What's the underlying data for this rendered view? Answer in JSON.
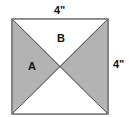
{
  "diagram": {
    "shape": "square",
    "side_length": "4\"",
    "labels": {
      "top_dimension": "4\"",
      "right_dimension": "4\"",
      "region_a": "A",
      "region_b": "B"
    },
    "regions": [
      {
        "name": "A",
        "position": "left triangle",
        "shaded": true
      },
      {
        "name": "B",
        "position": "top triangle",
        "shaded": false
      },
      {
        "name": "right",
        "position": "right triangle",
        "shaded": true
      },
      {
        "name": "bottom",
        "position": "bottom triangle",
        "shaded": false
      }
    ],
    "colors": {
      "shaded": "#b3b3b3",
      "unshaded": "#ffffff",
      "stroke": "#6e6e6e",
      "text": "#111111"
    }
  }
}
